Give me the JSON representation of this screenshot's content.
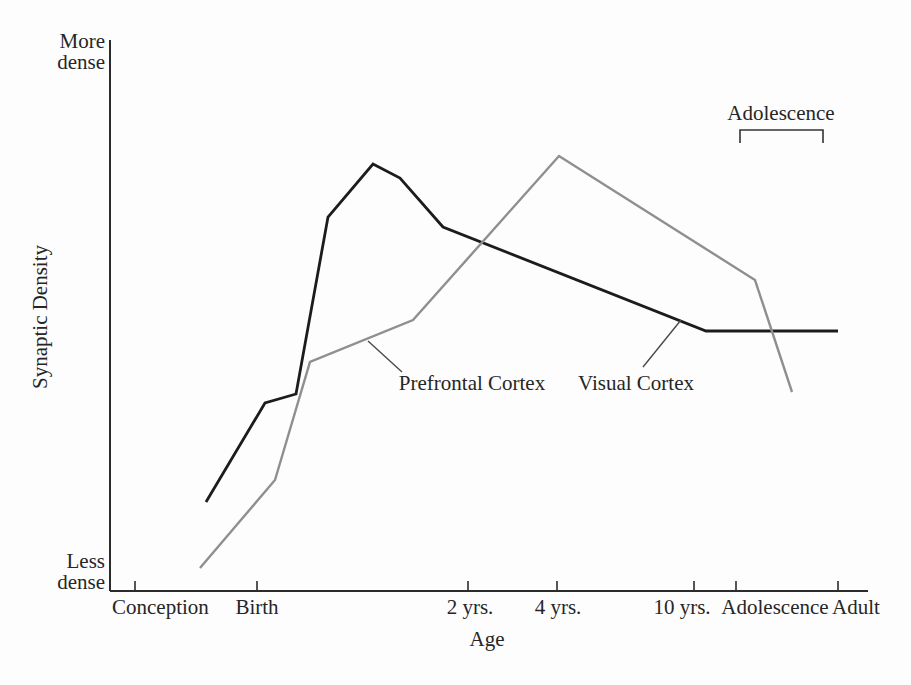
{
  "page": {
    "background": "#fdfdfd",
    "text_color": "#262626"
  },
  "labels": {
    "y_top_line1": "More",
    "y_top_line2": "dense",
    "y_bottom_line1": "Less",
    "y_bottom_line2": "dense",
    "y_title": "Synaptic Density",
    "x_title": "Age",
    "adolescence_bracket": "Adolescence",
    "series_prefrontal": "Prefrontal Cortex",
    "series_visual": "Visual Cortex",
    "x_ticks": {
      "conception": "Conception",
      "birth": "Birth",
      "yrs2": "2 yrs.",
      "yrs4": "4 yrs.",
      "yrs10": "10 yrs.",
      "adolescence": "Adolescence",
      "adult": "Adult"
    }
  },
  "colors": {
    "visual_cortex_line": "#1c1c1c",
    "prefrontal_cortex_line": "#8f8f8f",
    "axis": "#2b2b2b",
    "leader_line": "#4a4a4a",
    "bracket": "#333333"
  },
  "chart_data": {
    "type": "line",
    "title": "",
    "xlabel": "Age",
    "ylabel": "Synaptic Density",
    "y_axis_qualitative": [
      "Less dense",
      "More dense"
    ],
    "x_categories": [
      "Conception",
      "Birth",
      "2 yrs.",
      "4 yrs.",
      "10 yrs.",
      "Adolescence",
      "Adult"
    ],
    "grid": false,
    "legend": "inline labels with leader lines",
    "axes_px": {
      "x0": 110,
      "y_top": 40,
      "y_bottom": 591,
      "x_right": 868
    },
    "x_tick_px": [
      135,
      257,
      468,
      557,
      694,
      736,
      838
    ],
    "tick_len": 10,
    "series": [
      {
        "name": "Visual Cortex",
        "color": "#1c1c1c",
        "stroke_width": 2.8,
        "points_px": [
          [
            206,
            502
          ],
          [
            265,
            403
          ],
          [
            296,
            394
          ],
          [
            328,
            217
          ],
          [
            373,
            164
          ],
          [
            400,
            178
          ],
          [
            443,
            227
          ],
          [
            706,
            331
          ],
          [
            838,
            331
          ]
        ],
        "description": "Rises steeply around birth, peaks between Birth and 2 yrs., declines and flattens to an adult plateau"
      },
      {
        "name": "Prefrontal Cortex",
        "color": "#8f8f8f",
        "stroke_width": 2.4,
        "points_px": [
          [
            200,
            568
          ],
          [
            275,
            480
          ],
          [
            310,
            362
          ],
          [
            413,
            320
          ],
          [
            559,
            156
          ],
          [
            755,
            280
          ],
          [
            792,
            392
          ]
        ],
        "description": "Rises gradually from conception, peaks near 4 yrs., declines through adolescence"
      }
    ],
    "leader_lines_px": [
      {
        "for": "Prefrontal Cortex",
        "x1": 368,
        "y1": 341,
        "x2": 402,
        "y2": 372
      },
      {
        "for": "Visual Cortex",
        "x1": 681,
        "y1": 320,
        "x2": 643,
        "y2": 367
      }
    ],
    "adolescence_bracket_px": {
      "x1": 740,
      "x2": 823,
      "y": 130,
      "tick_down": 13
    }
  }
}
